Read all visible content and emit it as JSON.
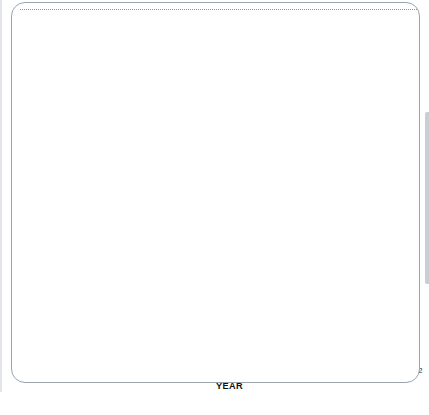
{
  "chart_data": {
    "type": "line",
    "title": "",
    "xlabel": "YEAR",
    "ylabel": "NEWSPAPER ENDORSEMENTS (%)",
    "xlim": [
      1932,
      2012
    ],
    "ylim": [
      0,
      80
    ],
    "grid": false,
    "legend_position": "inline-annotations",
    "x_major_ticks": [
      1932,
      1940,
      1948,
      1956,
      1964,
      1972,
      1980,
      1988,
      1996,
      2004,
      2012
    ],
    "x_minor_ticks": [
      1936,
      1944,
      1952,
      1960,
      1968,
      1976,
      1984,
      1992,
      2000,
      2008
    ],
    "y_ticks": [
      0,
      10,
      20,
      30,
      40,
      50,
      60,
      70,
      80
    ],
    "x": [
      1932,
      1936,
      1940,
      1944,
      1948,
      1952,
      1956,
      1960,
      1964,
      1968,
      1972,
      1976,
      1980,
      1984,
      1988,
      1992,
      1996,
      2000,
      2004,
      2008,
      2012
    ],
    "series": [
      {
        "name": "Republican",
        "color": "#3c3c3c",
        "values": [
          52,
          60,
          64,
          60,
          65,
          67,
          62,
          58,
          36,
          61,
          71,
          62,
          43,
          58,
          31,
          15,
          19,
          48,
          50,
          35.5,
          45
        ]
      },
      {
        "name": "Democratic",
        "color": "#8a8a8a",
        "values": [
          41,
          36,
          23,
          22,
          15,
          15,
          15,
          15.5,
          42,
          27,
          5,
          12,
          12,
          9,
          11,
          14,
          10,
          35,
          49,
          64,
          42
        ]
      },
      {
        "name": "Neutral",
        "color": "#b9b9b9",
        "values": [
          7,
          7,
          13,
          18,
          15,
          15,
          18,
          26,
          23,
          24,
          23,
          24,
          42,
          32,
          58,
          67,
          70,
          52,
          0.5,
          0.5,
          14
        ]
      }
    ],
    "annotations": [
      {
        "text": "Republican",
        "x": 1973,
        "y": 71,
        "swatch_color": "#3c3c3c",
        "swatch_side": "left"
      },
      {
        "text": "Democratic",
        "x": 1974,
        "y": 5,
        "swatch_color": "#8a8a8a",
        "swatch_side": "left"
      },
      {
        "text": "Neutral",
        "x": 1955,
        "y": 26,
        "swatch_color": "#b9b9b9",
        "swatch_side": "right"
      }
    ]
  }
}
